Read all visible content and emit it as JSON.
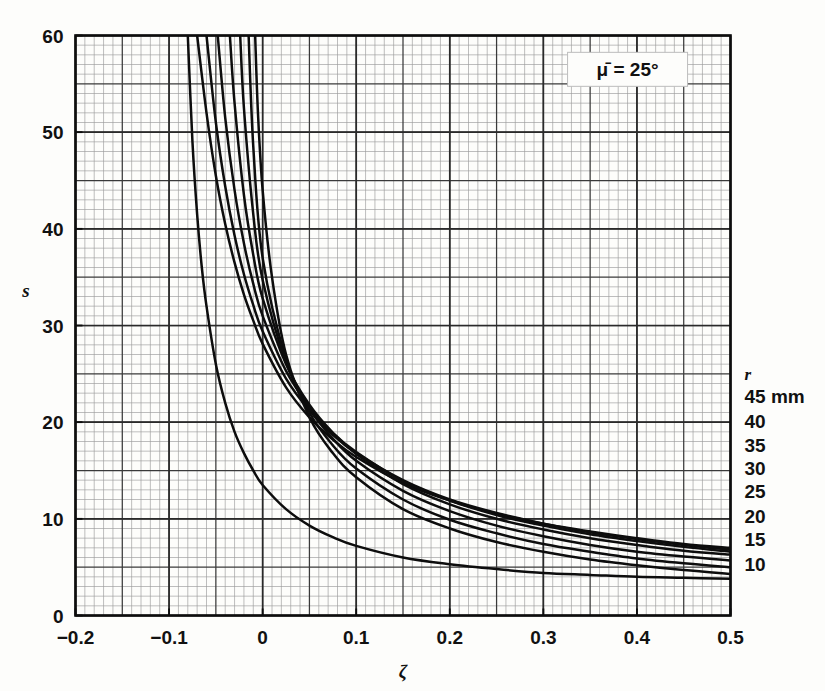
{
  "chart_data": {
    "type": "line",
    "title": "",
    "xlabel": "ζ",
    "ylabel": "s",
    "xlim": [
      -0.2,
      0.5
    ],
    "ylim": [
      0,
      60
    ],
    "xticks": [
      -0.2,
      -0.1,
      0,
      0.1,
      0.2,
      0.3,
      0.4,
      0.5
    ],
    "xticklabels": [
      "−0.2",
      "−0.1",
      "0",
      "0.1",
      "0.2",
      "0.3",
      "0.4",
      "0.5"
    ],
    "yticks": [
      0,
      10,
      20,
      30,
      40,
      50,
      60
    ],
    "yticklabels": [
      "0",
      "10",
      "20",
      "30",
      "40",
      "50",
      "60"
    ],
    "grid": "major and minor graph-paper grid",
    "minor_step_x": 0.01,
    "minor_step_y": 1,
    "major_step_x": 0.05,
    "major_step_y": 5,
    "legend_position": "right-of-axes curve end labels",
    "annotations": [
      {
        "text": "μ̄ = 25°",
        "x": 0.39,
        "y": 56.5,
        "boxed": true
      }
    ],
    "series_label_header": "r",
    "series_unit": "mm",
    "series": [
      {
        "name": "45 mm",
        "r": 45,
        "label": "45 mm",
        "points": [
          [
            -0.07,
            60
          ],
          [
            -0.06,
            52
          ],
          [
            -0.05,
            45.5
          ],
          [
            -0.04,
            40.5
          ],
          [
            -0.03,
            36.5
          ],
          [
            -0.02,
            33.2
          ],
          [
            -0.01,
            30.5
          ],
          [
            0.0,
            28.1
          ],
          [
            0.025,
            23.6
          ],
          [
            0.05,
            20.5
          ],
          [
            0.075,
            18.2
          ],
          [
            0.1,
            16.4
          ],
          [
            0.15,
            13.7
          ],
          [
            0.2,
            11.9
          ],
          [
            0.25,
            10.5
          ],
          [
            0.3,
            9.5
          ],
          [
            0.35,
            8.7
          ],
          [
            0.4,
            8.0
          ],
          [
            0.45,
            7.4
          ],
          [
            0.5,
            7.0
          ]
        ]
      },
      {
        "name": "40 mm",
        "r": 40,
        "label": "40",
        "points": [
          [
            -0.06,
            60
          ],
          [
            -0.05,
            51
          ],
          [
            -0.04,
            44.4
          ],
          [
            -0.03,
            39.3
          ],
          [
            -0.02,
            35.3
          ],
          [
            -0.01,
            32.1
          ],
          [
            0.0,
            29.4
          ],
          [
            0.025,
            24.5
          ],
          [
            0.05,
            21.2
          ],
          [
            0.075,
            18.7
          ],
          [
            0.1,
            16.8
          ],
          [
            0.15,
            14.0
          ],
          [
            0.2,
            12.0
          ],
          [
            0.25,
            10.6
          ],
          [
            0.3,
            9.5
          ],
          [
            0.35,
            8.6
          ],
          [
            0.4,
            7.9
          ],
          [
            0.45,
            7.3
          ],
          [
            0.5,
            6.8
          ]
        ]
      },
      {
        "name": "35 mm",
        "r": 35,
        "label": "35",
        "points": [
          [
            -0.048,
            60
          ],
          [
            -0.04,
            51.5
          ],
          [
            -0.03,
            44.0
          ],
          [
            -0.02,
            38.5
          ],
          [
            -0.01,
            34.3
          ],
          [
            0.0,
            31.0
          ],
          [
            0.025,
            25.3
          ],
          [
            0.05,
            21.6
          ],
          [
            0.075,
            18.9
          ],
          [
            0.1,
            16.9
          ],
          [
            0.15,
            13.9
          ],
          [
            0.2,
            11.9
          ],
          [
            0.25,
            10.4
          ],
          [
            0.3,
            9.3
          ],
          [
            0.35,
            8.4
          ],
          [
            0.4,
            7.7
          ],
          [
            0.45,
            7.1
          ],
          [
            0.5,
            6.6
          ]
        ]
      },
      {
        "name": "30 mm",
        "r": 30,
        "label": "30",
        "points": [
          [
            -0.035,
            60
          ],
          [
            -0.03,
            53.0
          ],
          [
            -0.02,
            43.5
          ],
          [
            -0.01,
            37.3
          ],
          [
            0.0,
            32.8
          ],
          [
            0.025,
            26.0
          ],
          [
            0.05,
            21.8
          ],
          [
            0.075,
            18.9
          ],
          [
            0.1,
            16.7
          ],
          [
            0.15,
            13.6
          ],
          [
            0.2,
            11.5
          ],
          [
            0.25,
            10.0
          ],
          [
            0.3,
            8.9
          ],
          [
            0.35,
            8.0
          ],
          [
            0.4,
            7.3
          ],
          [
            0.45,
            6.7
          ],
          [
            0.5,
            6.3
          ]
        ]
      },
      {
        "name": "25 mm",
        "r": 25,
        "label": "25",
        "points": [
          [
            -0.024,
            60
          ],
          [
            -0.02,
            52.5
          ],
          [
            -0.01,
            41.5
          ],
          [
            0.0,
            34.7
          ],
          [
            0.025,
            26.2
          ],
          [
            0.05,
            21.4
          ],
          [
            0.075,
            18.3
          ],
          [
            0.1,
            16.0
          ],
          [
            0.15,
            12.9
          ],
          [
            0.2,
            10.8
          ],
          [
            0.25,
            9.3
          ],
          [
            0.3,
            8.2
          ],
          [
            0.35,
            7.3
          ],
          [
            0.4,
            6.6
          ],
          [
            0.45,
            6.1
          ],
          [
            0.5,
            5.7
          ]
        ]
      },
      {
        "name": "20 mm",
        "r": 20,
        "label": "20",
        "points": [
          [
            -0.015,
            60
          ],
          [
            -0.01,
            48.5
          ],
          [
            0.0,
            37.0
          ],
          [
            0.025,
            26.5
          ],
          [
            0.05,
            21.0
          ],
          [
            0.075,
            17.6
          ],
          [
            0.1,
            15.2
          ],
          [
            0.15,
            12.0
          ],
          [
            0.2,
            9.9
          ],
          [
            0.25,
            8.5
          ],
          [
            0.3,
            7.4
          ],
          [
            0.35,
            6.6
          ],
          [
            0.4,
            5.9
          ],
          [
            0.45,
            5.4
          ],
          [
            0.5,
            5.0
          ]
        ]
      },
      {
        "name": "15 mm",
        "r": 15,
        "label": "15",
        "points": [
          [
            -0.008,
            60
          ],
          [
            -0.005,
            52.0
          ],
          [
            0.0,
            44.0
          ],
          [
            0.01,
            35.0
          ],
          [
            0.025,
            27.0
          ],
          [
            0.05,
            20.5
          ],
          [
            0.075,
            16.8
          ],
          [
            0.1,
            14.3
          ],
          [
            0.15,
            11.0
          ],
          [
            0.2,
            9.0
          ],
          [
            0.25,
            7.6
          ],
          [
            0.3,
            6.6
          ],
          [
            0.35,
            5.8
          ],
          [
            0.4,
            5.2
          ],
          [
            0.45,
            4.7
          ],
          [
            0.5,
            4.3
          ]
        ]
      },
      {
        "name": "10 mm",
        "r": 10,
        "label": "10",
        "points": [
          [
            -0.08,
            60
          ],
          [
            -0.075,
            49.0
          ],
          [
            -0.07,
            41.5
          ],
          [
            -0.065,
            36.0
          ],
          [
            -0.06,
            32.0
          ],
          [
            -0.05,
            26.0
          ],
          [
            -0.04,
            22.0
          ],
          [
            -0.03,
            19.0
          ],
          [
            -0.02,
            16.8
          ],
          [
            -0.01,
            15.0
          ],
          [
            0.0,
            13.5
          ],
          [
            0.025,
            11.0
          ],
          [
            0.05,
            9.3
          ],
          [
            0.075,
            8.1
          ],
          [
            0.1,
            7.2
          ],
          [
            0.15,
            6.0
          ],
          [
            0.2,
            5.3
          ],
          [
            0.25,
            4.8
          ],
          [
            0.3,
            4.4
          ],
          [
            0.35,
            4.2
          ],
          [
            0.4,
            4.0
          ],
          [
            0.45,
            3.9
          ],
          [
            0.5,
            3.8
          ]
        ]
      }
    ],
    "curve_end_labels": [
      {
        "label": "r",
        "y_value": 25.0
      },
      {
        "label": "45 mm",
        "y_value": 22.6
      },
      {
        "label": "40",
        "y_value": 20.0
      },
      {
        "label": "35",
        "y_value": 17.5
      },
      {
        "label": "30",
        "y_value": 15.2
      },
      {
        "label": "25",
        "y_value": 12.8
      },
      {
        "label": "20",
        "y_value": 10.2
      },
      {
        "label": "15",
        "y_value": 7.8
      },
      {
        "label": "10",
        "y_value": 5.2
      }
    ],
    "colors": {
      "curve": "#0d0d0d",
      "frame": "#0d0d0d",
      "major_grid": "#3a3a3a",
      "minor_grid": "#9a9a9a",
      "background": "#fdfdfb",
      "text": "#111111"
    }
  }
}
